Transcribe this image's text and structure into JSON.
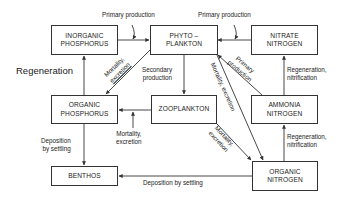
{
  "diagram": {
    "type": "nutrient-cycle-flow",
    "side_label": "Regeneration",
    "nodes": {
      "inorganic_phosphorus": {
        "line1": "INORGANIC",
        "line2": "PHOSPHORUS"
      },
      "phytoplankton": {
        "line1": "PHYTO –",
        "line2": "PLANKTON"
      },
      "nitrate_nitrogen": {
        "line1": "NITRATE",
        "line2": "NITROGEN"
      },
      "organic_phosphorus": {
        "line1": "ORGANIC",
        "line2": "PHOSPHORUS"
      },
      "zooplankton": {
        "line1": "ZOOPLANKTON"
      },
      "ammonia_nitrogen": {
        "line1": "AMMONIA",
        "line2": "NITROGEN"
      },
      "benthos": {
        "line1": "BENTHOS"
      },
      "organic_nitrogen": {
        "line1": "ORGANIC",
        "line2": "NITROGEN"
      }
    },
    "edges": {
      "primary_production_p": {
        "from": "INORGANIC PHOSPHORUS",
        "to": "PHYTO-PLANKTON",
        "label": "Primary production"
      },
      "primary_production_n": {
        "from": "NITRATE NITROGEN",
        "to": "PHYTO-PLANKTON",
        "label": "Primary production"
      },
      "primary_production_ammonia": {
        "from": "AMMONIA NITROGEN",
        "to": "PHYTO-PLANKTON",
        "line1": "Primary",
        "line2": "production"
      },
      "phyto_to_orgp": {
        "from": "PHYTO-PLANKTON",
        "to": "ORGANIC PHOSPHORUS",
        "line1": "Mortality,",
        "line2": "excretion"
      },
      "secondary_production": {
        "from": "PHYTO-PLANKTON",
        "to": "ZOOPLANKTON",
        "line1": "Secondary",
        "line2": "production"
      },
      "phyto_to_orgn": {
        "from": "PHYTO-PLANKTON",
        "to": "ORGANIC NITROGEN",
        "label": "Mortality, excretion"
      },
      "zoo_to_orgp": {
        "from": "ZOOPLANKTON",
        "to": "ORGANIC PHOSPHORUS",
        "line1": "Mortality,",
        "line2": "excretion"
      },
      "zoo_to_orgn": {
        "from": "ZOOPLANKTON",
        "to": "ORGANIC NITROGEN",
        "line1": "Mortality,",
        "line2": "excretion"
      },
      "regen_p": {
        "from": "ORGANIC PHOSPHORUS",
        "to": "INORGANIC PHOSPHORUS"
      },
      "regen_nitrate": {
        "from": "AMMONIA NITROGEN",
        "to": "NITRATE NITROGEN",
        "line1": "Regeneration,",
        "line2": "nitrification"
      },
      "regen_ammonia": {
        "from": "ORGANIC NITROGEN",
        "to": "AMMONIA NITROGEN",
        "line1": "Regeneration,",
        "line2": "nitrification"
      },
      "deposition_p": {
        "from": "ORGANIC PHOSPHORUS",
        "to": "BENTHOS",
        "line1": "Deposition",
        "line2": "by settling"
      },
      "deposition_n": {
        "from": "ORGANIC NITROGEN",
        "to": "BENTHOS",
        "label": "Deposition by settling"
      }
    }
  }
}
